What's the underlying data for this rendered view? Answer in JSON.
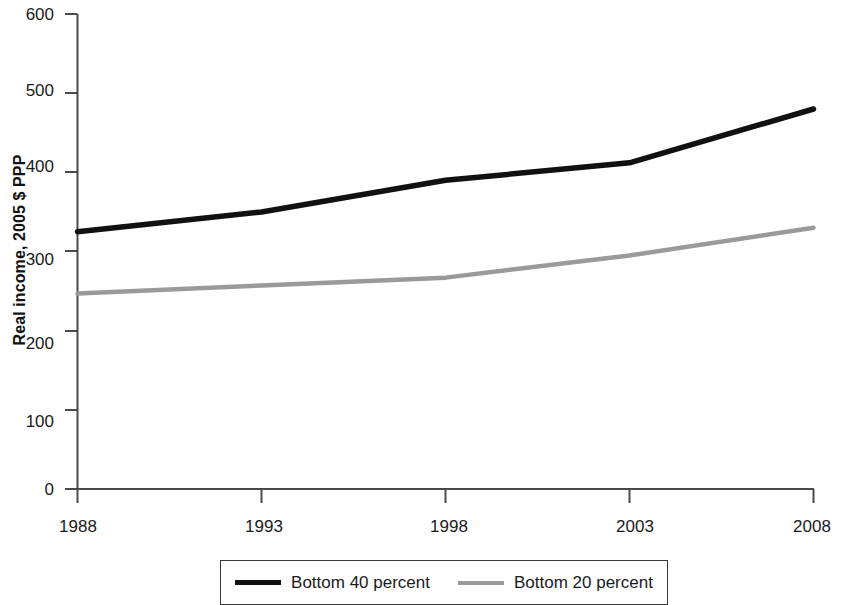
{
  "chart_data": {
    "type": "line",
    "title": "",
    "xlabel": "",
    "ylabel": "Real income, 2005 $ PPP",
    "x": [
      1988,
      1993,
      1998,
      2003,
      2008
    ],
    "xticklabels": [
      "1988",
      "1993",
      "1998",
      "2003",
      "2008"
    ],
    "yticklabels": [
      "0",
      "100",
      "200",
      "300",
      "400",
      "500",
      "600"
    ],
    "yticks": [
      0,
      100,
      200,
      300,
      400,
      500,
      600
    ],
    "xlim": [
      1988,
      2008
    ],
    "ylim": [
      0,
      600
    ],
    "grid": false,
    "legend_position": "bottom",
    "series": [
      {
        "name": "Bottom 40 percent",
        "color": "#111111",
        "values": [
          325,
          350,
          390,
          412,
          480
        ]
      },
      {
        "name": "Bottom 20 percent",
        "color": "#9a9a9a",
        "values": [
          247,
          257,
          267,
          295,
          330
        ]
      }
    ]
  },
  "axes": {
    "y_label": "Real income, 2005 $ PPP",
    "y_ticks": [
      "600",
      "500",
      "400",
      "300",
      "200",
      "100",
      "0"
    ],
    "x_ticks": [
      "1988",
      "1993",
      "1998",
      "2003",
      "2008"
    ]
  },
  "legend": {
    "items": [
      {
        "label": "Bottom 40 percent",
        "color": "#111111"
      },
      {
        "label": "Bottom 20 percent",
        "color": "#9a9a9a"
      }
    ]
  }
}
